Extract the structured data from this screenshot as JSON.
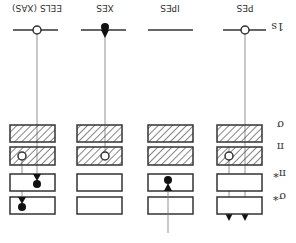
{
  "colors": {
    "line": "#333333",
    "thin_line": "#777777",
    "hatch": "#333333",
    "background": "#ffffff"
  },
  "row_labels": {
    "core": "1s",
    "sigma": "σ",
    "pi": "π",
    "pi_star": "π*",
    "sigma_star": "σ*"
  },
  "columns": [
    {
      "id": "pes",
      "label": "PES"
    },
    {
      "id": "ipes",
      "label": "IPES"
    },
    {
      "id": "xes",
      "label": "XES"
    },
    {
      "id": "eels",
      "label": "EELS (XAS)"
    }
  ]
}
